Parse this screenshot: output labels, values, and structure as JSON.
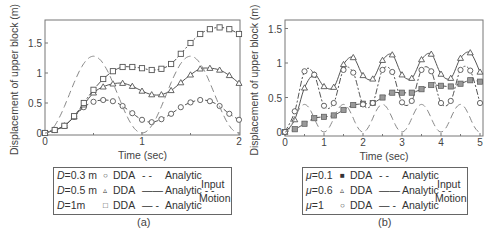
{
  "chart_data": [
    {
      "id": "a",
      "type": "line",
      "caption": "(a)",
      "xlabel": "Time (sec)",
      "ylabel": "Displacement of upper block (m)",
      "xlim": [
        0,
        2
      ],
      "ylim": [
        0,
        1.85
      ],
      "xticks": [
        0,
        1,
        2
      ],
      "xtick_labels": [
        "0",
        "1",
        "2"
      ],
      "yticks": [
        0,
        0.5,
        1,
        1.5
      ],
      "ytick_labels": [
        "0",
        "0.5",
        "1",
        "1.5"
      ],
      "grid": false,
      "x": [
        0,
        0.1,
        0.2,
        0.3,
        0.4,
        0.5,
        0.6,
        0.7,
        0.8,
        0.9,
        1.0,
        1.1,
        1.2,
        1.3,
        1.4,
        1.5,
        1.6,
        1.7,
        1.8,
        1.9,
        2.0
      ],
      "series": [
        {
          "name": "D=0.3 m DDA",
          "marker": "circle",
          "line": "dash",
          "values": [
            0,
            0.05,
            0.12,
            0.27,
            0.43,
            0.52,
            0.55,
            0.53,
            0.45,
            0.33,
            0.22,
            0.18,
            0.23,
            0.32,
            0.43,
            0.51,
            0.55,
            0.53,
            0.45,
            0.32,
            0.22
          ]
        },
        {
          "name": "D=0.5 m DDA",
          "marker": "triangle",
          "line": "solid",
          "values": [
            0,
            0.05,
            0.12,
            0.27,
            0.47,
            0.67,
            0.77,
            0.82,
            0.83,
            0.78,
            0.7,
            0.64,
            0.64,
            0.71,
            0.84,
            0.97,
            1.07,
            1.08,
            1.05,
            0.96,
            0.83
          ]
        },
        {
          "name": "D=1m DDA",
          "marker": "square",
          "line": "dashdot",
          "values": [
            0,
            0.05,
            0.12,
            0.28,
            0.5,
            0.72,
            0.9,
            1.03,
            1.1,
            1.1,
            1.08,
            1.05,
            1.07,
            1.15,
            1.32,
            1.5,
            1.65,
            1.73,
            1.76,
            1.73,
            1.65
          ]
        },
        {
          "name": "Input Motion",
          "marker": "none",
          "line": "longdash",
          "amplitude": 0.64,
          "period": 1.0,
          "formula": "A*(1-cos(2*pi*t/T))"
        }
      ],
      "legend": {
        "rows": [
          {
            "param": "D",
            "value": "=0.3 m",
            "marker": "○",
            "dda": "DDA",
            "style": "- -",
            "analytic": "Analytic"
          },
          {
            "param": "D",
            "value": "=0.5 m",
            "marker": "▵",
            "dda": "DDA",
            "style": "——",
            "analytic": "Analytic - -"
          },
          {
            "param": "D",
            "value": "=1m",
            "marker": "□",
            "dda": "DDA",
            "style": "— -",
            "analytic": "Analytic"
          }
        ],
        "input_line1": "Input",
        "input_line2": "Motion"
      }
    },
    {
      "id": "b",
      "type": "line",
      "caption": "(b)",
      "xlabel": "Time (sec)",
      "ylabel": "Displacement of upper block (m)",
      "xlim": [
        0,
        5
      ],
      "ylim": [
        0,
        1.62
      ],
      "xticks": [
        0,
        1,
        2,
        3,
        4,
        5
      ],
      "xtick_labels": [
        "0",
        "1",
        "2",
        "3",
        "4",
        "5"
      ],
      "yticks": [
        0,
        0.5,
        1,
        1.5
      ],
      "ytick_labels": [
        "0",
        "0.5",
        "1",
        "1.5"
      ],
      "grid": false,
      "x": [
        0,
        0.25,
        0.5,
        0.75,
        1.0,
        1.25,
        1.5,
        1.75,
        2.0,
        2.25,
        2.5,
        2.75,
        3.0,
        3.25,
        3.5,
        3.75,
        4.0,
        4.25,
        4.5,
        4.75,
        5.0
      ],
      "series": [
        {
          "name": "μ=0.1 DDA",
          "marker": "filled-square",
          "line": "dash",
          "values": [
            0,
            0.04,
            0.12,
            0.2,
            0.22,
            0.24,
            0.32,
            0.39,
            0.41,
            0.42,
            0.5,
            0.57,
            0.57,
            0.57,
            0.62,
            0.68,
            0.67,
            0.66,
            0.7,
            0.75,
            0.73
          ]
        },
        {
          "name": "μ=0.6 DDA",
          "marker": "triangle",
          "line": "solid",
          "values": [
            0,
            0.18,
            0.64,
            0.83,
            0.66,
            0.65,
            0.98,
            1.08,
            0.82,
            0.77,
            1.04,
            1.12,
            0.83,
            0.78,
            1.05,
            1.13,
            0.84,
            0.78,
            1.07,
            1.15,
            0.87
          ]
        },
        {
          "name": "μ=1 DDA",
          "marker": "circle",
          "line": "dashdot",
          "values": [
            0,
            0.3,
            0.88,
            0.83,
            0.38,
            0.42,
            0.9,
            0.86,
            0.4,
            0.42,
            0.9,
            0.87,
            0.43,
            0.45,
            0.9,
            0.88,
            0.42,
            0.45,
            0.9,
            0.89,
            0.42
          ]
        },
        {
          "name": "Input Motion",
          "marker": "none",
          "line": "longdash",
          "amplitude": 0.2,
          "period": 1.0,
          "formula": "A*(1-cos(2*pi*t/T))"
        }
      ],
      "legend": {
        "rows": [
          {
            "param": "μ",
            "value": "=0.1",
            "marker": "■",
            "dda": "DDA",
            "style": "- -",
            "analytic": "Analytic"
          },
          {
            "param": "μ",
            "value": "=0.6",
            "marker": "▵",
            "dda": "DDA",
            "style": "——",
            "analytic": "Analytic - -"
          },
          {
            "param": "μ",
            "value": "=1",
            "marker": "○",
            "dda": "DDA",
            "style": "— -",
            "analytic": "Analytic"
          }
        ],
        "input_line1": "Input",
        "input_line2": "Motion"
      }
    }
  ],
  "colors": {
    "axis": "#777777",
    "series": "#555555",
    "input": "#888888",
    "text": "#444444"
  }
}
